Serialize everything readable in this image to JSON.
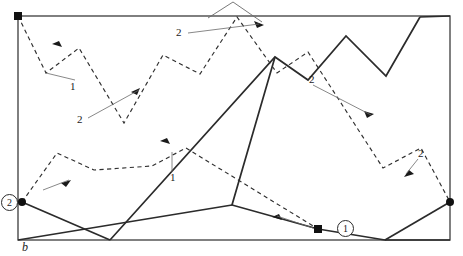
{
  "figure": {
    "kind": "reflection-path-diagram",
    "background": "#ffffff",
    "stroke_solid": "#2b2b2b",
    "stroke_dashed": "#3a3a3a",
    "stroke_leader": "#6a6a6a",
    "frame": {
      "x": 18,
      "y": 16,
      "width": 432,
      "height": 224
    },
    "axis_label": "b",
    "markers": [
      {
        "id": "marker-1",
        "label": "1",
        "cx": 318,
        "cy": 229,
        "ring_cx": 344,
        "ring_cy": 228
      },
      {
        "id": "marker-2",
        "label": "2",
        "cx": 22,
        "cy": 202,
        "ring_cx": 9,
        "ring_cy": 202
      }
    ],
    "endpoint_dots": [
      {
        "cx": 18,
        "cy": 16
      },
      {
        "cx": 22,
        "cy": 202
      },
      {
        "cx": 318,
        "cy": 229
      },
      {
        "cx": 450,
        "cy": 202
      }
    ],
    "callouts": [
      {
        "id": "callout-1-upper-left",
        "text": "1",
        "x": 70,
        "y": 84
      },
      {
        "id": "callout-2-lower-left",
        "text": "2",
        "x": 77,
        "y": 119
      },
      {
        "id": "callout-2-top-middle",
        "text": "2",
        "x": 176,
        "y": 33
      },
      {
        "id": "callout-2-middle-right",
        "text": "2",
        "x": 310,
        "y": 79
      },
      {
        "id": "callout-1-middle",
        "text": "1",
        "x": 172,
        "y": 176
      },
      {
        "id": "callout-2-right",
        "text": "2",
        "x": 419,
        "y": 154
      }
    ],
    "paths": {
      "dashed_ray": "M18,16 L45,72 L78,48 L122,122 L163,55 L199,73 L237,16 L276,72 L307,52 L383,167 L420,148 L450,202",
      "dashed_ray_2": "M22,202 L57,153 L93,169 L152,165 L185,148 L318,229",
      "solid_ray": "M110,240 L275,57 L308,79 L345,36 L385,74 L420,18",
      "solid_ray_tail": "M22,202 L110,240",
      "solid_ray_tail_right": "M450,240 L385,240",
      "solid_ray_right": "M420,18 L450,16",
      "solid_ray_lower_right": "M276,150 L232,204 L318,229",
      "solid_ray_bottom": "M232,204 L275,57"
    }
  }
}
